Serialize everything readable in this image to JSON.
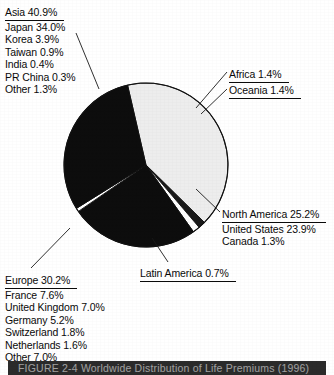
{
  "figure": {
    "caption": "FIGURE 2-4  Worldwide Distribution of Life Premiums (1996)"
  },
  "colors": {
    "asia_fill": "#ededed",
    "africa_fill": "#1a1a1a",
    "oceania_fill": "#ffffff",
    "north_america_fill": "#0d0d0d",
    "latin_america_fill": "#ffffff",
    "europe_fill": "#0d0d0d",
    "outline": "#111111",
    "text": "#0a0a0a",
    "caption_band": "#2b2b2b"
  },
  "labels": {
    "asia": {
      "header": "Asia 40.9%",
      "items": [
        "Japan 34.0%",
        "Korea 3.9%",
        "Taiwan 0.9%",
        "India 0.4%",
        "PR China 0.3%",
        "Other 1.3%"
      ]
    },
    "africa": {
      "header": "Africa 1.4%",
      "items": []
    },
    "oceania": {
      "header": "Oceania 1.4%",
      "items": []
    },
    "north_america": {
      "header": "North America 25.2%",
      "items": [
        "United States 23.9%",
        "Canada 1.3%"
      ]
    },
    "latin_america": {
      "header": "Latin America 0.7%",
      "items": []
    },
    "europe": {
      "header": "Europe 30.2%",
      "items": [
        "France 7.6%",
        "United Kingdom 7.0%",
        "Germany 5.2%",
        "Switzerland 1.8%",
        "Netherlands 1.6%",
        "Other 7.0%"
      ]
    }
  },
  "chart_data": {
    "type": "pie",
    "title": "FIGURE 2-4  Worldwide Distribution of Life Premiums (1996)",
    "unit": "percent",
    "total": 100.0,
    "legend": "callout-labels",
    "grid": false,
    "categories": [
      "Asia",
      "Africa",
      "Oceania",
      "North America",
      "Latin America",
      "Europe"
    ],
    "values": [
      40.9,
      1.4,
      1.4,
      25.2,
      0.7,
      30.2
    ],
    "slices": [
      {
        "label": "Asia",
        "value": 40.9,
        "color": "#ededed",
        "breakdown": [
          {
            "label": "Japan",
            "value": 34.0
          },
          {
            "label": "Korea",
            "value": 3.9
          },
          {
            "label": "Taiwan",
            "value": 0.9
          },
          {
            "label": "India",
            "value": 0.4
          },
          {
            "label": "PR China",
            "value": 0.3
          },
          {
            "label": "Other",
            "value": 1.3
          }
        ]
      },
      {
        "label": "Africa",
        "value": 1.4,
        "color": "#1a1a1a",
        "breakdown": []
      },
      {
        "label": "Oceania",
        "value": 1.4,
        "color": "#ffffff",
        "breakdown": []
      },
      {
        "label": "North America",
        "value": 25.2,
        "color": "#0d0d0d",
        "breakdown": [
          {
            "label": "United States",
            "value": 23.9
          },
          {
            "label": "Canada",
            "value": 1.3
          }
        ]
      },
      {
        "label": "Latin America",
        "value": 0.7,
        "color": "#ffffff",
        "breakdown": []
      },
      {
        "label": "Europe",
        "value": 30.2,
        "color": "#0d0d0d",
        "breakdown": [
          {
            "label": "France",
            "value": 7.6
          },
          {
            "label": "United Kingdom",
            "value": 7.0
          },
          {
            "label": "Germany",
            "value": 5.2
          },
          {
            "label": "Switzerland",
            "value": 1.8
          },
          {
            "label": "Netherlands",
            "value": 1.6
          },
          {
            "label": "Other",
            "value": 7.0
          }
        ]
      }
    ],
    "geometry": {
      "center_x": 146,
      "center_y": 165,
      "radius": 82,
      "start_angle_deg": -103
    }
  }
}
